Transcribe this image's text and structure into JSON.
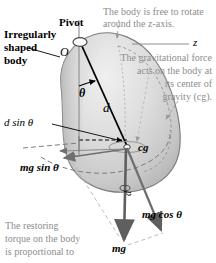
{
  "figure": {
    "colors": {
      "body_light": "#e9e9e9",
      "body_mid": "#d2d2d2",
      "body_dark": "#b6b6b6",
      "outline": "#6f6f6f",
      "vector_gray": "#7a7a7a",
      "note_text": "#8d8d8d",
      "label_text": "#000000",
      "axis_gray": "#8d8d8d"
    }
  },
  "labels": {
    "pivot": "Pivot",
    "irregular_body_line1": "Irregularly",
    "irregular_body_line2": "shaped",
    "irregular_body_line3": "body",
    "origin": "O",
    "z_axis": "z",
    "theta": "θ",
    "distance": "d",
    "cg": "cg",
    "d_sin_theta": "d sin θ",
    "mg_sin_theta": "mg sin θ",
    "mg_cos_theta": "mg cos θ",
    "mg": "mg",
    "d_vertical": "d"
  },
  "notes": {
    "rotation_line1": "The body is free to rotate",
    "rotation_line2": "around the z-axis.",
    "gravity_line1": "The gravitational force",
    "gravity_line2": "acts on the body at",
    "gravity_line3": "its center of",
    "gravity_line4": "gravity (cg).",
    "torque_line1": "The restoring",
    "torque_line2": "torque on the body",
    "torque_line3": "is proportional to"
  }
}
